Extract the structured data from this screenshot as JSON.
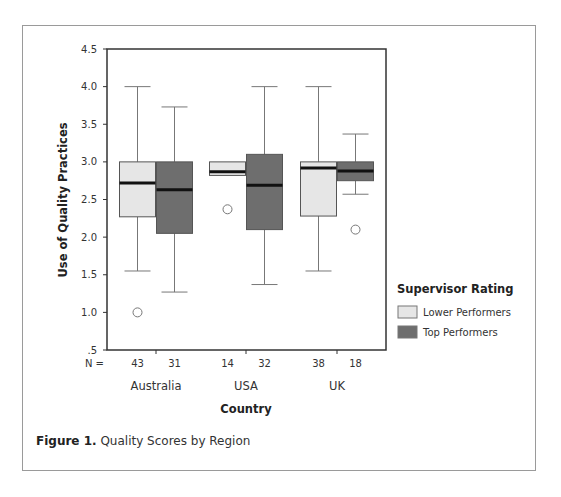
{
  "chart_data": {
    "type": "boxplot",
    "title": "",
    "caption_label": "Figure 1.",
    "caption_text": "Quality Scores by Region",
    "xlabel": "Country",
    "ylabel": "Use of Quality Practices",
    "ylim": [
      0.5,
      4.5
    ],
    "yticks": [
      ".5",
      "1.0",
      "1.5",
      "2.0",
      "2.5",
      "3.0",
      "3.5",
      "4.0",
      "4.5"
    ],
    "ytick_values": [
      0.5,
      1.0,
      1.5,
      2.0,
      2.5,
      3.0,
      3.5,
      4.0,
      4.5
    ],
    "grid": false,
    "n_prefix": "N =",
    "categories": [
      "Australia",
      "USA",
      "UK"
    ],
    "legend": {
      "title": "Supervisor Rating",
      "position": "right",
      "entries": [
        {
          "name": "Lower Performers",
          "color": "#e6e6e6"
        },
        {
          "name": "Top Performers",
          "color": "#6e6e6e"
        }
      ]
    },
    "series": [
      {
        "name": "Lower Performers",
        "color": "#e6e6e6",
        "boxes": [
          {
            "category": "Australia",
            "n": "43",
            "whisker_low": 1.55,
            "q1": 2.27,
            "median": 2.72,
            "q3": 3.0,
            "whisker_high": 4.0,
            "outliers": [
              1.0
            ]
          },
          {
            "category": "USA",
            "n": "14",
            "whisker_low": null,
            "q1": 2.82,
            "median": 2.87,
            "q3": 3.0,
            "whisker_high": null,
            "outliers": [
              2.37
            ]
          },
          {
            "category": "UK",
            "n": "38",
            "whisker_low": 1.55,
            "q1": 2.28,
            "median": 2.92,
            "q3": 3.0,
            "whisker_high": 4.0,
            "outliers": []
          }
        ]
      },
      {
        "name": "Top Performers",
        "color": "#6e6e6e",
        "boxes": [
          {
            "category": "Australia",
            "n": "31",
            "whisker_low": 1.27,
            "q1": 2.05,
            "median": 2.63,
            "q3": 3.0,
            "whisker_high": 3.73,
            "outliers": []
          },
          {
            "category": "USA",
            "n": "32",
            "whisker_low": 1.37,
            "q1": 2.1,
            "median": 2.69,
            "q3": 3.1,
            "whisker_high": 4.0,
            "outliers": []
          },
          {
            "category": "UK",
            "n": "18",
            "whisker_low": 2.57,
            "q1": 2.75,
            "median": 2.88,
            "q3": 3.0,
            "whisker_high": 3.37,
            "outliers": [
              2.1
            ]
          }
        ]
      }
    ]
  }
}
